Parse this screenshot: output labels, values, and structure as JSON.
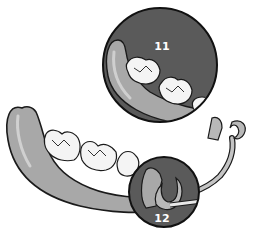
{
  "diagram": {
    "callouts": [
      {
        "id": "callout-11",
        "label": "11",
        "depicts": "magnified view of posterior teeth on denture base"
      },
      {
        "id": "callout-12",
        "label": "12",
        "depicts": "magnified view of C-shaped clasp on abutment"
      }
    ],
    "colors": {
      "background": "#ffffff",
      "callout_fill": "#5a5a5a",
      "gum_base": "#a8a8a8",
      "gum_highlight": "#c8c8c8",
      "tooth": "#f4f4f4",
      "clasp": "#b8b8b8",
      "outline": "#1a1a1a"
    }
  }
}
